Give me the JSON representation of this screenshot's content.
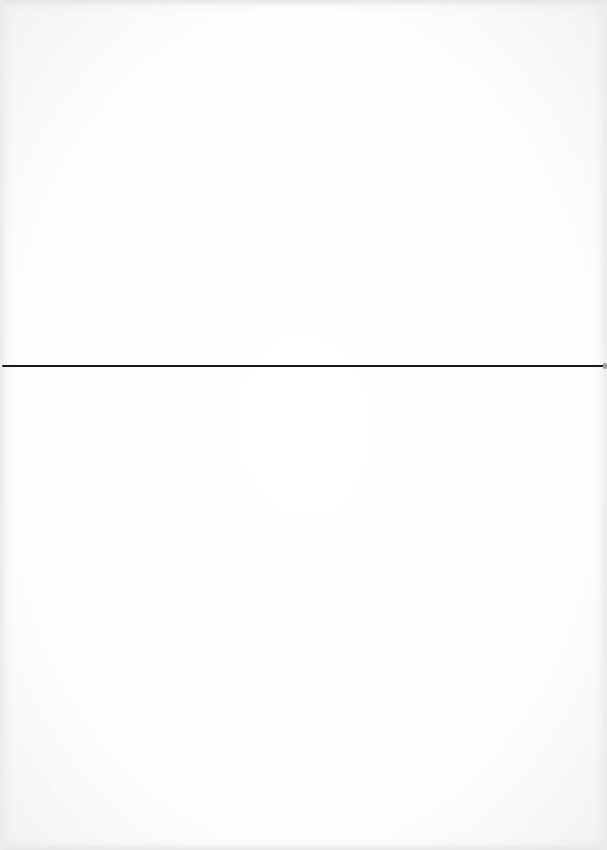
{
  "document": {
    "type": "blank scanned page",
    "text_content": [],
    "elements": [
      {
        "kind": "horizontal-rule",
        "y": 366,
        "color": "#1a1a1a"
      }
    ],
    "background_color": "#ffffff"
  }
}
